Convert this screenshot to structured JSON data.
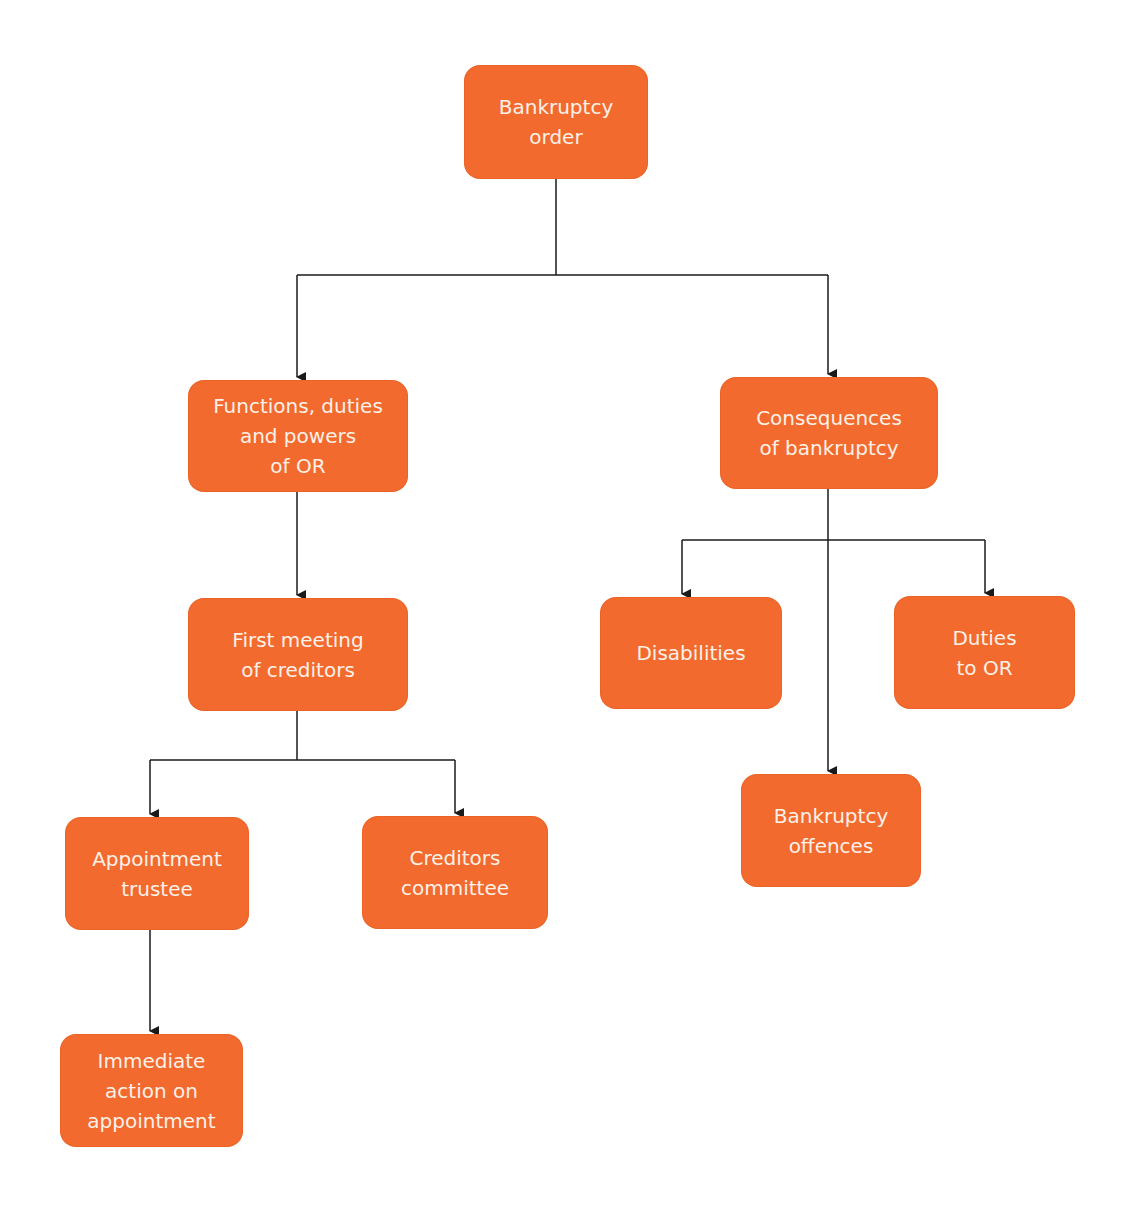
{
  "diagram": {
    "type": "flowchart",
    "colors": {
      "node_fill": "#f26a2e",
      "node_text": "#fdf1e8",
      "connector": "#1a1a1a",
      "background": "#ffffff"
    },
    "nodes": {
      "bankruptcy_order": {
        "label": "Bankruptcy\norder"
      },
      "functions_of_or": {
        "label": "Functions, duties\nand powers\nof OR"
      },
      "consequences": {
        "label": "Consequences\nof bankruptcy"
      },
      "first_meeting": {
        "label": "First meeting\nof creditors"
      },
      "disabilities": {
        "label": "Disabilities"
      },
      "duties_to_or": {
        "label": "Duties\nto OR"
      },
      "appointment_trustee": {
        "label": "Appointment\ntrustee"
      },
      "creditors_committee": {
        "label": "Creditors\ncommittee"
      },
      "bankruptcy_offences": {
        "label": "Bankruptcy\noffences"
      },
      "immediate_action": {
        "label": "Immediate\naction on\nappointment"
      }
    },
    "edges": [
      {
        "from": "bankruptcy_order",
        "to": "functions_of_or"
      },
      {
        "from": "bankruptcy_order",
        "to": "consequences"
      },
      {
        "from": "functions_of_or",
        "to": "first_meeting"
      },
      {
        "from": "first_meeting",
        "to": "appointment_trustee"
      },
      {
        "from": "first_meeting",
        "to": "creditors_committee"
      },
      {
        "from": "appointment_trustee",
        "to": "immediate_action"
      },
      {
        "from": "consequences",
        "to": "disabilities"
      },
      {
        "from": "consequences",
        "to": "duties_to_or"
      },
      {
        "from": "consequences",
        "to": "bankruptcy_offences"
      }
    ]
  }
}
